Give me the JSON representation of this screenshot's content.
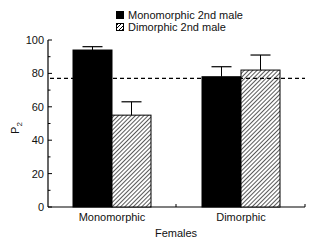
{
  "chart_data": {
    "type": "bar",
    "title": "",
    "xlabel": "Females",
    "ylabel": "P2",
    "ylabel_main": "P",
    "ylabel_sub": "2",
    "categories": [
      "Monomorphic",
      "Dimorphic"
    ],
    "series": [
      {
        "name": "Monomorphic 2nd male",
        "fill": "solid",
        "color": "#000000",
        "values": [
          94,
          78
        ],
        "error_upper": [
          96,
          84
        ]
      },
      {
        "name": "Dimorphic 2nd male",
        "fill": "hatched",
        "color": "#000000",
        "values": [
          55,
          82
        ],
        "error_upper": [
          63,
          91
        ]
      }
    ],
    "reference_line": {
      "style": "dashed",
      "value": 77
    },
    "ylim": [
      0,
      100
    ],
    "yticks": [
      0,
      20,
      40,
      60,
      80,
      100
    ],
    "grid": false,
    "legend_position": "top-center"
  },
  "legend": {
    "items": [
      {
        "label": "Monomorphic 2nd male"
      },
      {
        "label": "Dimorphic 2nd male"
      }
    ]
  }
}
